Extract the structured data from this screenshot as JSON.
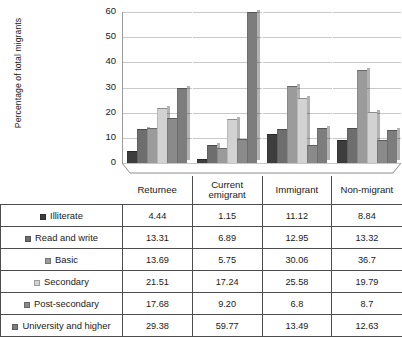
{
  "chart_data": {
    "type": "bar",
    "title": "",
    "xlabel": "",
    "ylabel": "Percentage of total migrants",
    "ylim": [
      0,
      60
    ],
    "yticks": [
      0,
      10,
      20,
      30,
      40,
      50,
      60
    ],
    "grid": true,
    "legend_position": "table-row-labels",
    "categories": [
      "Returnee",
      "Current emigrant",
      "Immigrant",
      "Non-migrant"
    ],
    "series": [
      {
        "name": "Illiterate",
        "color": "#3d3d3d",
        "values": [
          4.44,
          1.15,
          11.12,
          8.84
        ],
        "labels": [
          "4.44",
          "1.15",
          "11.12",
          "8.84"
        ]
      },
      {
        "name": "Read and write",
        "color": "#6e6e6e",
        "values": [
          13.31,
          6.89,
          12.95,
          13.32
        ],
        "labels": [
          "13.31",
          "6.89",
          "12.95",
          "13.32"
        ]
      },
      {
        "name": "Basic",
        "color": "#9b9b9b",
        "values": [
          13.69,
          5.75,
          30.06,
          36.7
        ],
        "labels": [
          "13.69",
          "5.75",
          "30.06",
          "36.7"
        ]
      },
      {
        "name": "Secondary",
        "color": "#d2d2d2",
        "values": [
          21.51,
          17.24,
          25.58,
          19.79
        ],
        "labels": [
          "21.51",
          "17.24",
          "25.58",
          "19.79"
        ]
      },
      {
        "name": "Post-secondary",
        "color": "#8a8a8a",
        "values": [
          17.68,
          9.2,
          6.8,
          8.7
        ],
        "labels": [
          "17.68",
          "9.20",
          "6.8",
          "8.7"
        ]
      },
      {
        "name": "University and higher",
        "color": "#7d7d7d",
        "values": [
          29.38,
          59.77,
          13.49,
          12.63
        ],
        "labels": [
          "29.38",
          "59.77",
          "13.49",
          "12.63"
        ]
      }
    ]
  },
  "table": {
    "corner_label": "",
    "column_headers": [
      "Returnee",
      "Current emigrant",
      "Immigrant",
      "Non-migrant"
    ]
  }
}
